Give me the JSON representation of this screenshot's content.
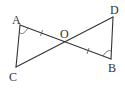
{
  "diagram": {
    "type": "geometry-figure",
    "points": {
      "A": {
        "label": "A"
      },
      "B": {
        "label": "B"
      },
      "C": {
        "label": "C"
      },
      "D": {
        "label": "D"
      },
      "O": {
        "label": "O"
      }
    },
    "segments": [
      "AB",
      "CD",
      "AC",
      "BD"
    ],
    "equal_marks": [
      {
        "segment": "AO",
        "ticks": 1
      },
      {
        "segment": "OB",
        "ticks": 1
      }
    ],
    "angle_marks": [
      {
        "vertex": "A",
        "between": [
          "C",
          "O"
        ]
      },
      {
        "vertex": "B",
        "between": [
          "O",
          "D"
        ]
      }
    ],
    "colors": {
      "stroke": "#333333",
      "background": "#ffffff"
    }
  }
}
